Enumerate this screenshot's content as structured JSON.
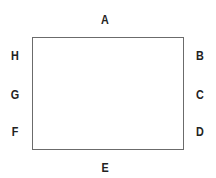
{
  "diagram": {
    "shape": "rectangle",
    "stroke_color": "#6b6b6b",
    "labels": {
      "top": "A",
      "right_top": "B",
      "right_middle": "C",
      "right_bottom": "D",
      "bottom": "E",
      "left_bottom": "F",
      "left_middle": "G",
      "left_top": "H"
    }
  }
}
